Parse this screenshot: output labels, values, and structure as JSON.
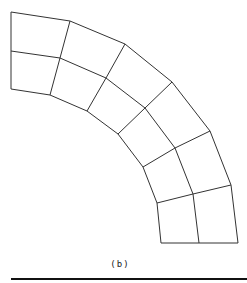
{
  "figure": {
    "caption": "(b)",
    "stroke_color": "#333333",
    "rule_color": "#111111"
  },
  "mesh": {
    "description": "Curved quarter-annulus finite element mesh, 2 radial layers x 6 circumferential elements",
    "radial_layers": 2,
    "circumferential_elements": 6,
    "outer_arc": [
      [
        11,
        12
      ],
      [
        70,
        21
      ],
      [
        125,
        44
      ],
      [
        172,
        82
      ],
      [
        210,
        131
      ],
      [
        231,
        185
      ],
      [
        238,
        243
      ]
    ],
    "middle_arc": [
      [
        11,
        51
      ],
      [
        60,
        58
      ],
      [
        106,
        78
      ],
      [
        145,
        108
      ],
      [
        175,
        148
      ],
      [
        193,
        194
      ],
      [
        199,
        243
      ]
    ],
    "inner_arc": [
      [
        11,
        89
      ],
      [
        50,
        95
      ],
      [
        87,
        111
      ],
      [
        118,
        134
      ],
      [
        143,
        167
      ],
      [
        157,
        203
      ],
      [
        161,
        243
      ]
    ]
  }
}
